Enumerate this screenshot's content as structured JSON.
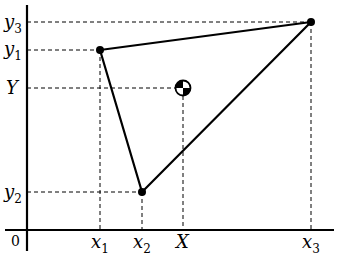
{
  "diagram": {
    "type": "center-of-mass-triangle",
    "origin_label": "0",
    "points": [
      {
        "id": "p1",
        "x_label": "x",
        "x_sub": "1",
        "y_label": "y",
        "y_sub": "1",
        "px": 100,
        "py": 50
      },
      {
        "id": "p2",
        "x_label": "x",
        "x_sub": "2",
        "y_label": "y",
        "y_sub": "2",
        "px": 142,
        "py": 192
      },
      {
        "id": "p3",
        "x_label": "x",
        "x_sub": "3",
        "y_label": "y",
        "y_sub": "3",
        "px": 311,
        "py": 22
      }
    ],
    "center_of_mass": {
      "x_label": "X",
      "y_label": "Y",
      "px": 183,
      "py": 88
    },
    "axes": {
      "x_axis_y": 230,
      "y_axis_x": 27
    },
    "colors": {
      "line": "#000000",
      "background": "#ffffff"
    }
  }
}
